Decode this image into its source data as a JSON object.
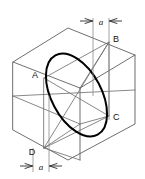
{
  "figure": {
    "stroke_colors": {
      "box_edge": "#4a4a4a",
      "diagonal": "#6a6a6a",
      "ellipse": "#000000",
      "extension": "#8a8a8a",
      "dimension": "#2a2a2a"
    },
    "vertex_labels": [
      {
        "id": "A",
        "text": "A",
        "x": 35,
        "y": 78
      },
      {
        "id": "B",
        "text": "B",
        "x": 113,
        "y": 42
      },
      {
        "id": "C",
        "text": "C",
        "x": 113,
        "y": 116
      },
      {
        "id": "D",
        "text": "D",
        "x": 32,
        "y": 152
      }
    ],
    "dimensions": [
      {
        "id": "top-a",
        "label": "a",
        "x": 100,
        "y": 22
      },
      {
        "id": "bottom-a",
        "label": "a",
        "x": 41,
        "y": 168
      }
    ]
  }
}
